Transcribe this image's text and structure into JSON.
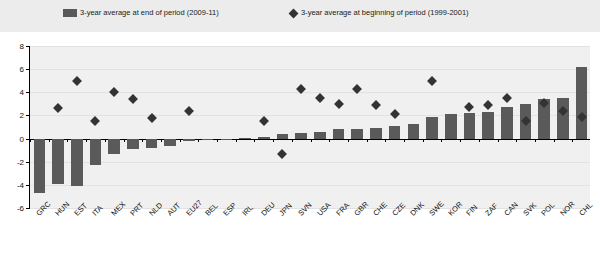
{
  "legend": {
    "bar_label": "3-year average at end of period (2009-11)",
    "diamond_label": "3-year average at beginning of period (1999-2001)",
    "bar_color": "#595959",
    "diamond_color": "#333333"
  },
  "chart_data": {
    "type": "bar",
    "title": "",
    "subtitle": "",
    "xlabel": "",
    "ylabel": "",
    "ylim": [
      -6,
      8
    ],
    "yticks": [
      8,
      6,
      4,
      2,
      0,
      -2,
      -4,
      -6
    ],
    "grid": true,
    "legend_position": "top",
    "categories": [
      "GRC",
      "HUN",
      "EST",
      "ITA",
      "MEX",
      "PRT",
      "NLD",
      "AUT",
      "EU27",
      "BEL",
      "ESP",
      "IRL",
      "DEU",
      "JPN",
      "SVN",
      "USA",
      "FRA",
      "GBR",
      "CHE",
      "CZE",
      "DNK",
      "SWE",
      "KOR",
      "FIN",
      "ZAF",
      "CAN",
      "SVK",
      "POL",
      "NOR",
      "CHL"
    ],
    "series": [
      {
        "name": "3-year average at end of period (2009-11)",
        "type": "bar",
        "color": "#5a5a5a",
        "values": [
          -4.7,
          -3.9,
          -4.1,
          -2.3,
          -1.3,
          -0.9,
          -0.8,
          -0.6,
          -0.2,
          -0.15,
          -0.1,
          0.05,
          0.1,
          0.4,
          0.5,
          0.6,
          0.8,
          0.8,
          0.9,
          1.1,
          1.3,
          1.9,
          2.1,
          2.2,
          2.3,
          2.7,
          3.0,
          3.4,
          3.5,
          6.2
        ]
      },
      {
        "name": "3-year average at beginning of period (1999-2001)",
        "type": "scatter",
        "marker": "diamond",
        "color": "#333333",
        "values": [
          null,
          2.6,
          5.0,
          1.5,
          4.0,
          3.4,
          1.8,
          null,
          2.4,
          null,
          null,
          null,
          1.5,
          -1.3,
          4.3,
          3.5,
          3.0,
          4.3,
          2.9,
          2.1,
          null,
          5.0,
          null,
          2.7,
          2.9,
          3.5,
          1.5,
          3.1,
          2.4,
          1.9
        ]
      }
    ]
  }
}
